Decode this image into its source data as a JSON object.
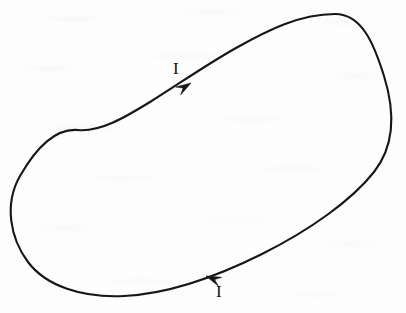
{
  "figure": {
    "kind": "physics-diagram",
    "background_color": "#fdfdfd",
    "stroke_color": "#161616",
    "stroke_width_px": 2.1,
    "width_px": 406,
    "height_px": 313
  },
  "loop": {
    "name": "current-loop-curve",
    "closed": true,
    "circulation": "clockwise",
    "path": "M 335 14 C 300 14 268 30 236 48 C 204 66 176 86 150 102 C 124 118 100 132 78 130 C 56 128 36 148 20 176 C 4 204 10 238 28 262 C 46 286 82 298 124 296 C 166 294 214 278 262 254 C 310 230 352 200 374 172 C 396 144 394 108 384 76 C 374 44 362 14 335 14 Z",
    "extremes": {
      "leftmost": [
        10,
        210
      ],
      "topmost": [
        335,
        14
      ],
      "rightmost": [
        392,
        130
      ],
      "bottommost": [
        110,
        297
      ]
    }
  },
  "arrows": [
    {
      "name": "current-arrow-top",
      "tip": [
        191,
        83
      ],
      "angle_deg": -32,
      "direction": "up-right",
      "length_px": 15,
      "half_width_px": 4.6
    },
    {
      "name": "current-arrow-bottom",
      "tip": [
        206,
        276
      ],
      "angle_deg": 202,
      "direction": "left-down",
      "length_px": 15,
      "half_width_px": 4.6
    }
  ],
  "labels": {
    "top": {
      "text": "I",
      "meaning": "electric current",
      "x": 173,
      "y": 60
    },
    "bottom": {
      "text": "I",
      "meaning": "electric current",
      "x": 216,
      "y": 283
    }
  }
}
